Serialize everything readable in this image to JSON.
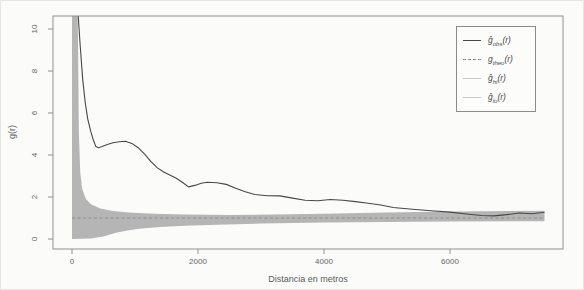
{
  "figure": {
    "background": "#fbfbfa",
    "axis_color": "#8f8f8d",
    "tick_text_color": "#666664"
  },
  "chart_data": {
    "type": "line",
    "title": "",
    "xlabel": "Distancia en metros",
    "ylabel": "g(r)",
    "xlim": [
      -300,
      7800
    ],
    "ylim": [
      -0.45,
      10.65
    ],
    "x_ticks": [
      0,
      2000,
      4000,
      6000
    ],
    "y_ticks": [
      0,
      2,
      4,
      6,
      8,
      10
    ],
    "grid": false,
    "legend_position": "top-right",
    "envelope_fill": "#b5b5b5",
    "series": [
      {
        "name": "g_obs",
        "label_base": "ĝ",
        "label_sub": "obs",
        "style": "solid",
        "color": "#474747",
        "points": [
          [
            95,
            10.8
          ],
          [
            130,
            9.2
          ],
          [
            170,
            7.6
          ],
          [
            210,
            6.5
          ],
          [
            250,
            5.7
          ],
          [
            300,
            5.1
          ],
          [
            340,
            4.7
          ],
          [
            380,
            4.4
          ],
          [
            420,
            4.35
          ],
          [
            480,
            4.4
          ],
          [
            560,
            4.5
          ],
          [
            650,
            4.58
          ],
          [
            750,
            4.63
          ],
          [
            850,
            4.65
          ],
          [
            950,
            4.55
          ],
          [
            1050,
            4.35
          ],
          [
            1150,
            4.05
          ],
          [
            1250,
            3.7
          ],
          [
            1350,
            3.4
          ],
          [
            1450,
            3.2
          ],
          [
            1550,
            3.05
          ],
          [
            1650,
            2.9
          ],
          [
            1750,
            2.7
          ],
          [
            1850,
            2.48
          ],
          [
            1950,
            2.55
          ],
          [
            2050,
            2.65
          ],
          [
            2150,
            2.7
          ],
          [
            2300,
            2.68
          ],
          [
            2450,
            2.6
          ],
          [
            2600,
            2.42
          ],
          [
            2750,
            2.25
          ],
          [
            2900,
            2.12
          ],
          [
            3100,
            2.06
          ],
          [
            3300,
            2.05
          ],
          [
            3500,
            1.95
          ],
          [
            3700,
            1.85
          ],
          [
            3900,
            1.82
          ],
          [
            4100,
            1.88
          ],
          [
            4300,
            1.85
          ],
          [
            4500,
            1.78
          ],
          [
            4700,
            1.7
          ],
          [
            4900,
            1.62
          ],
          [
            5100,
            1.5
          ],
          [
            5400,
            1.42
          ],
          [
            5700,
            1.35
          ],
          [
            6000,
            1.28
          ],
          [
            6300,
            1.18
          ],
          [
            6500,
            1.12
          ],
          [
            6700,
            1.1
          ],
          [
            6900,
            1.16
          ],
          [
            7100,
            1.24
          ],
          [
            7300,
            1.2
          ],
          [
            7500,
            1.27
          ]
        ]
      },
      {
        "name": "g_theo",
        "label_base": "g",
        "label_sub": "theo",
        "style": "dashed",
        "color": "#8e8e8e",
        "points": [
          [
            0,
            1
          ],
          [
            7500,
            1
          ]
        ]
      },
      {
        "name": "g_hi",
        "label_base": "ĝ",
        "label_sub": "hi",
        "style": "solid-light",
        "color": "#c6c6c6",
        "points": [
          [
            0,
            11
          ],
          [
            90,
            11
          ],
          [
            110,
            5
          ],
          [
            130,
            3.2
          ],
          [
            160,
            2.4
          ],
          [
            220,
            1.9
          ],
          [
            300,
            1.65
          ],
          [
            450,
            1.45
          ],
          [
            650,
            1.33
          ],
          [
            900,
            1.26
          ],
          [
            1300,
            1.2
          ],
          [
            1800,
            1.16
          ],
          [
            2500,
            1.14
          ],
          [
            3200,
            1.16
          ],
          [
            4000,
            1.2
          ],
          [
            5000,
            1.26
          ],
          [
            6000,
            1.31
          ],
          [
            7000,
            1.34
          ],
          [
            7500,
            1.35
          ]
        ]
      },
      {
        "name": "g_lo",
        "label_base": "ĝ",
        "label_sub": "lo",
        "style": "solid-light",
        "color": "#c6c6c6",
        "points": [
          [
            0,
            0.0
          ],
          [
            300,
            0.02
          ],
          [
            500,
            0.12
          ],
          [
            700,
            0.3
          ],
          [
            900,
            0.42
          ],
          [
            1100,
            0.5
          ],
          [
            1400,
            0.57
          ],
          [
            1800,
            0.63
          ],
          [
            2300,
            0.68
          ],
          [
            3000,
            0.74
          ],
          [
            4000,
            0.78
          ],
          [
            5000,
            0.81
          ],
          [
            6000,
            0.83
          ],
          [
            7500,
            0.85
          ]
        ]
      }
    ]
  },
  "legend": {
    "tail_open": "(",
    "tail_var": "r",
    "tail_close": ")"
  }
}
